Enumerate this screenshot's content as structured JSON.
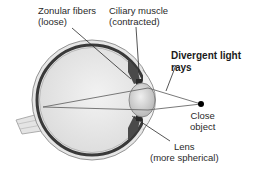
{
  "figure": {
    "type": "eye-accommodation-diagram",
    "labels": {
      "zonular_fibers": {
        "line1": "Zonular fibers",
        "line2": "(loose)"
      },
      "ciliary_muscle": {
        "line1": "Ciliary muscle",
        "line2": "(contracted)"
      },
      "divergent_rays": {
        "line1": "Divergent light",
        "line2": "rays"
      },
      "close_object": {
        "line1": "Close",
        "line2": "object"
      },
      "lens": {
        "line1": "Lens",
        "line2": "(more spherical)"
      }
    },
    "colors": {
      "sclera": "#d8d8d8",
      "choroid": "#3a3a3a",
      "vitreous": "#ececec",
      "lens": "#cfcfcf",
      "rays": "#6a6a6a",
      "object": "#000000"
    }
  }
}
